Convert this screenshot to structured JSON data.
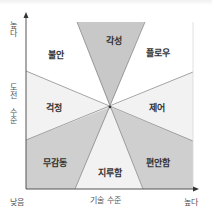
{
  "diagram": {
    "type": "flow-channel-quadrant",
    "y_axis": {
      "title": "도전 수준",
      "high_label": "높다"
    },
    "x_axis": {
      "title": "기술 수준",
      "high_label": "높다",
      "origin_label": "낮음"
    },
    "regions": [
      {
        "id": "arousal",
        "label": "각성"
      },
      {
        "id": "flow",
        "label": "플로우"
      },
      {
        "id": "control",
        "label": "제어"
      },
      {
        "id": "relaxation",
        "label": "편안함"
      },
      {
        "id": "boredom",
        "label": "지루함"
      },
      {
        "id": "apathy",
        "label": "무감동"
      },
      {
        "id": "worry",
        "label": "걱정"
      },
      {
        "id": "anxiety",
        "label": "불안"
      }
    ],
    "colors": {
      "dark_fill": "#cfcfcf",
      "light_fill": "#f2f2f2",
      "white_fill": "#ffffff",
      "line": "#8c8c8c",
      "axis": "#555555"
    }
  }
}
